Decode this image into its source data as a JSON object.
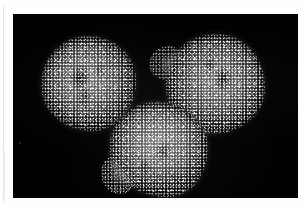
{
  "figure": {
    "kind": "fluorescence-micrograph",
    "modality": "grayscale",
    "background_color": "#010101",
    "mount_color": "#fefefe",
    "caption": "",
    "scale_bar": "",
    "annotations": []
  },
  "micrograph": {
    "field_label": "",
    "objects": [
      {
        "id": "spheroid-left",
        "label": "",
        "position": "upper-left",
        "shape": "round",
        "notes": "dense granular cell mass with dark central core"
      },
      {
        "id": "spheroid-right",
        "label": "",
        "position": "upper-right",
        "shape": "round",
        "notes": "round mass with wispy filament protruding from left flank"
      },
      {
        "id": "spheroid-bottom",
        "label": "",
        "position": "lower-center",
        "shape": "irregular",
        "notes": "brightest mass with ragged lower-left lobe"
      }
    ]
  },
  "palette": {
    "background": "#010101",
    "mount": "#fefefe",
    "tissue_bright": "#ffffff",
    "tissue_mid": "#6d6d6d",
    "tissue_dark": "#202020",
    "scan_artifact": "#e4e4e4"
  }
}
